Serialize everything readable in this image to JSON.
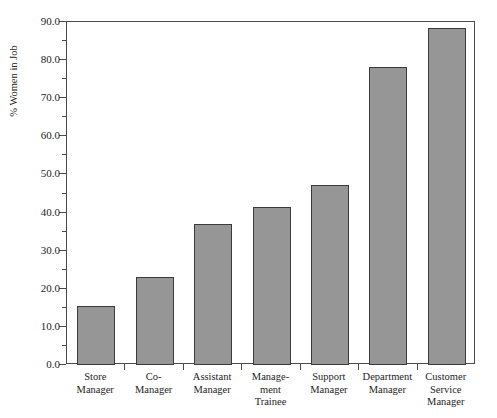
{
  "chart_data": {
    "type": "bar",
    "title": "",
    "xlabel": "",
    "ylabel": "% Women in Job",
    "ylim": [
      0.0,
      90.0
    ],
    "ytick_step": 10.0,
    "yminor_step": 5.0,
    "grid": false,
    "legend": false,
    "orientation": "vertical",
    "bar_color": "#969696",
    "bar_edge_color": "#3b3b3b",
    "axis_color": "#4b4b4b",
    "categories": [
      "Store Manager",
      "Co-Manager",
      "Assistant Manager",
      "Management Trainee",
      "Support Manager",
      "Department Manager",
      "Customer Service Manager"
    ],
    "category_lines": [
      [
        "Store",
        "Manager"
      ],
      [
        "Co-",
        "Manager"
      ],
      [
        "Assistant",
        "Manager"
      ],
      [
        "Manage-",
        "ment",
        "Trainee"
      ],
      [
        "Support",
        "Manager"
      ],
      [
        "Department",
        "Manager"
      ],
      [
        "Customer",
        "Service",
        "Manager"
      ]
    ],
    "values": [
      15.5,
      23.1,
      37.0,
      41.5,
      47.2,
      78.2,
      88.5
    ],
    "ytick_labels": [
      "0.0",
      "10.0",
      "20.0",
      "30.0",
      "40.0",
      "50.0",
      "60.0",
      "70.0",
      "80.0",
      "90.0"
    ],
    "ytick_values": [
      0.0,
      10.0,
      20.0,
      30.0,
      40.0,
      50.0,
      60.0,
      70.0,
      80.0,
      90.0
    ]
  }
}
